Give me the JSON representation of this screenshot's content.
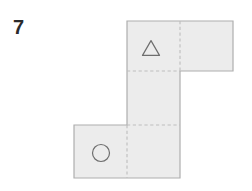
{
  "page": {
    "background_color": "#ffffff",
    "width": 252,
    "height": 191
  },
  "question": {
    "number_label": "7"
  },
  "figure": {
    "name": "cube-net-diagram",
    "face_fill_color": "#ececec",
    "outline_color": "#aeaeae",
    "fold_line_color": "#bdbdbd",
    "symbol_stroke_color": "#6e6e6e",
    "cell_size": 53,
    "grid": {
      "columns_x": [
        74,
        127,
        180,
        233
      ],
      "rows_y": [
        21,
        71,
        125,
        178
      ]
    },
    "faces": [
      {
        "id": "face-top-left",
        "col": 1,
        "row": 0,
        "symbol": "triangle"
      },
      {
        "id": "face-top-right",
        "col": 2,
        "row": 0,
        "symbol": "none"
      },
      {
        "id": "face-middle",
        "col": 1,
        "row": 1,
        "symbol": "none"
      },
      {
        "id": "face-bottom-center",
        "col": 1,
        "row": 2,
        "symbol": "none"
      },
      {
        "id": "face-bottom-left",
        "col": 0,
        "row": 2,
        "symbol": "circle"
      }
    ],
    "outline_path": "M 127 21 L 233 21 L 233 71 L 180 71 L 180 178 L 74 178 L 74 125 L 127 125 Z",
    "fold_lines": [
      {
        "id": "fold-vertical-top",
        "x1": 180,
        "y1": 21,
        "x2": 180,
        "y2": 71
      },
      {
        "id": "fold-horizontal-top",
        "x1": 127,
        "y1": 71,
        "x2": 180,
        "y2": 71
      },
      {
        "id": "fold-horizontal-middle",
        "x1": 127,
        "y1": 125,
        "x2": 180,
        "y2": 125
      },
      {
        "id": "fold-vertical-bottom",
        "x1": 127,
        "y1": 125,
        "x2": 127,
        "y2": 178
      }
    ],
    "symbols": [
      {
        "id": "triangle-symbol",
        "name": "triangle-icon",
        "shape": "triangle",
        "center_x": 151,
        "center_y": 48,
        "size": 17
      },
      {
        "id": "circle-symbol",
        "name": "circle-icon",
        "shape": "circle",
        "center_x": 101,
        "center_y": 153,
        "radius": 8.5
      }
    ]
  }
}
